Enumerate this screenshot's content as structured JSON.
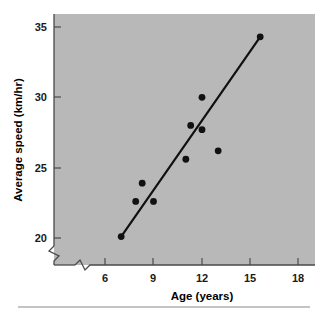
{
  "figure": {
    "background": "#ffffff",
    "plot_background": "#b8b8b8",
    "marker_color": "#111111",
    "line_color": "#111111",
    "axis_color": "#4a4a4a",
    "footer_rule_color": "#8a8a8a"
  },
  "axes": {
    "x_title": "Age (years)",
    "y_title": "Average speed (km/hr)",
    "x_ticks": [
      "6",
      "9",
      "12",
      "15",
      "18"
    ],
    "y_ticks": [
      "20",
      "25",
      "30",
      "35"
    ],
    "x_break": true,
    "y_break": true
  },
  "chart_data": {
    "type": "scatter",
    "title": "",
    "xlabel": "Age (years)",
    "ylabel": "Average speed (km/hr)",
    "xlim": [
      4.6,
      19.0
    ],
    "ylim": [
      19.0,
      35.9
    ],
    "xticks": [
      6,
      9,
      12,
      15,
      18
    ],
    "yticks": [
      20,
      25,
      30,
      35
    ],
    "grid": false,
    "legend": "none",
    "x": [
      7.0,
      7.9,
      8.3,
      9.0,
      11.0,
      11.3,
      12.0,
      12.0,
      13.0,
      15.6
    ],
    "y": [
      20.1,
      22.6,
      23.9,
      22.6,
      25.6,
      28.0,
      30.0,
      27.7,
      26.2,
      34.3
    ],
    "points": [
      {
        "x": 7.0,
        "y": 20.1
      },
      {
        "x": 7.9,
        "y": 22.6
      },
      {
        "x": 8.3,
        "y": 23.9
      },
      {
        "x": 9.0,
        "y": 22.6
      },
      {
        "x": 11.0,
        "y": 25.6
      },
      {
        "x": 11.3,
        "y": 28.0
      },
      {
        "x": 12.0,
        "y": 30.0
      },
      {
        "x": 12.0,
        "y": 27.7
      },
      {
        "x": 13.0,
        "y": 26.2
      },
      {
        "x": 15.6,
        "y": 34.3
      }
    ],
    "series": [
      {
        "name": "Observations",
        "type": "scatter",
        "x": [
          7.0,
          7.9,
          8.3,
          9.0,
          11.0,
          11.3,
          12.0,
          12.0,
          13.0,
          15.6
        ],
        "values": [
          20.1,
          22.6,
          23.9,
          22.6,
          25.6,
          28.0,
          30.0,
          27.7,
          26.2,
          34.3
        ]
      },
      {
        "name": "Fitted line",
        "type": "line",
        "x": [
          7.0,
          15.6
        ],
        "values": [
          20.1,
          34.3
        ]
      }
    ],
    "annotations": []
  }
}
